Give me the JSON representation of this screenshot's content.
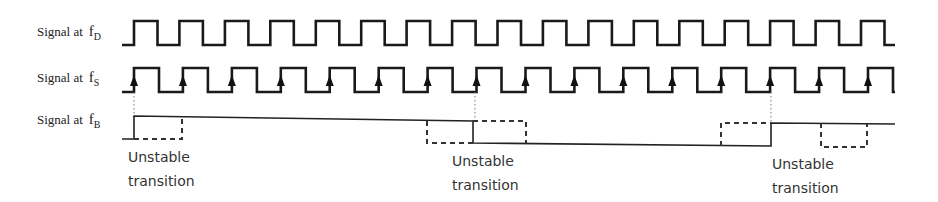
{
  "diagram": {
    "type": "timing-diagram",
    "signals": [
      {
        "id": "fD",
        "label_prefix": "Signal at",
        "symbol": "f",
        "subscript": "D",
        "rising_edges": 17,
        "kind": "clock"
      },
      {
        "id": "fS",
        "label_prefix": "Signal at",
        "symbol": "f",
        "subscript": "S",
        "rising_edges": 16,
        "kind": "sampling-clock",
        "edge_markers": "up-arrow"
      },
      {
        "id": "fB",
        "label_prefix": "Signal at",
        "symbol": "f",
        "subscript": "B",
        "kind": "output",
        "transitions": [
          "rise",
          "fall",
          "rise"
        ]
      }
    ],
    "annotations": [
      {
        "line1": "Unstable",
        "line2": "transition"
      },
      {
        "line1": "Unstable",
        "line2": "transition"
      },
      {
        "line1": "Unstable",
        "line2": "transition"
      }
    ],
    "colors": {
      "line": "#1a1a1a",
      "background": "#ffffff"
    }
  }
}
